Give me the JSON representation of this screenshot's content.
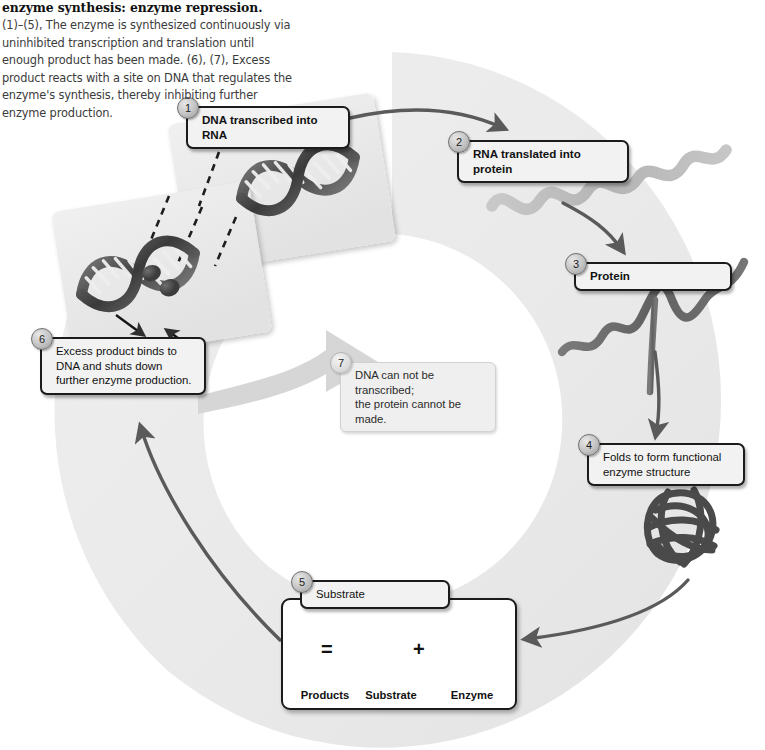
{
  "caption": {
    "title": "enzyme synthesis: enzyme repression.",
    "body": "(1)–(5), The enzyme is synthesized continuously via uninhibited transcription and translation until enough product has been made. (6), (7), Excess product reacts with a site on DNA that regulates the enzyme's synthesis, thereby inhibiting further enzyme production."
  },
  "steps": [
    {
      "number": "1",
      "label": "DNA transcribed into RNA"
    },
    {
      "number": "2",
      "label": "RNA translated into protein"
    },
    {
      "number": "3",
      "label": "Protein"
    },
    {
      "number": "4",
      "label": "Folds to form functional\nenzyme structure"
    },
    {
      "number": "5",
      "label": "Substrate"
    },
    {
      "number": "6",
      "label": "Excess product binds to\nDNA and shuts down\nfurther enzyme production."
    },
    {
      "number": "7",
      "label": "DNA can not be transcribed;\nthe protein cannot be made."
    }
  ],
  "reaction": {
    "products_label": "Products",
    "substrate_label": "Substrate",
    "enzyme_label": "Enzyme",
    "equals": "=",
    "plus": "+"
  },
  "colors": {
    "ring": "#ececec",
    "panel": "#e9e9e9",
    "arrow_dark": "#5a5a5a",
    "arrow_light": "#d2d2d2",
    "dna_dark": "#3f3f3f",
    "rna": "#b9b9b9",
    "protein": "#6e6e6e",
    "enzyme": "#4a4a4a",
    "box_border": "#1b1b1b",
    "box_fill": "#f2f2f2",
    "page": "#ffffff"
  }
}
